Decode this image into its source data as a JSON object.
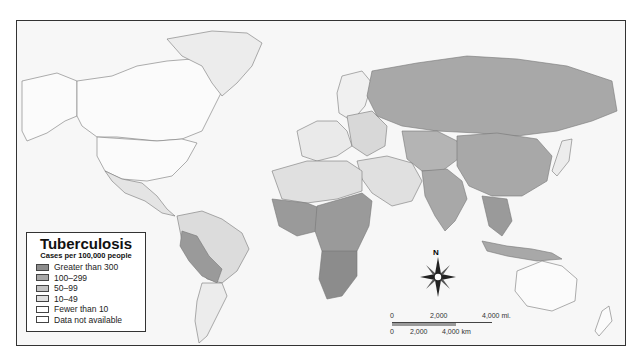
{
  "map": {
    "title": "Tuberculosis",
    "subtitle": "Cases per 100,000 people",
    "legend": [
      {
        "label": "Greater than 300",
        "color": "#8c8c8c"
      },
      {
        "label": "100–299",
        "color": "#a8a8a8"
      },
      {
        "label": "50–99",
        "color": "#c4c4c4"
      },
      {
        "label": "10–49",
        "color": "#e0e0e0"
      },
      {
        "label": "Fewer than 10",
        "color": "#ffffff"
      },
      {
        "label": "Data not available",
        "color": "#ffffff"
      }
    ],
    "compass": {
      "label": "N"
    },
    "scale": {
      "miles": [
        "0",
        "2,000",
        "4,000 mi."
      ],
      "km": [
        "0",
        "2,000",
        "4,000 km"
      ]
    }
  }
}
